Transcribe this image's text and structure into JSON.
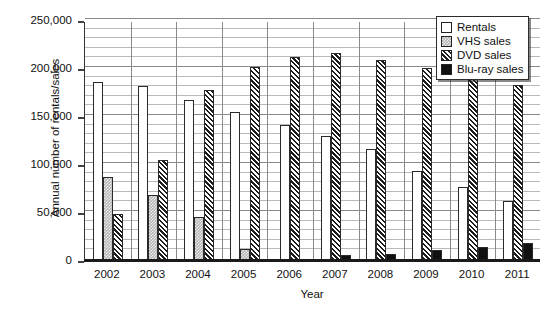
{
  "chart_data": {
    "type": "bar",
    "title": "",
    "xlabel": "Year",
    "ylabel": "Annual number of rentals/sales",
    "categories": [
      "2002",
      "2003",
      "2004",
      "2005",
      "2006",
      "2007",
      "2008",
      "2009",
      "2010",
      "2011"
    ],
    "ylim": [
      0,
      250000
    ],
    "ytick_labels": [
      "0",
      "50,000",
      "100,000",
      "150,000",
      "200,000",
      "250,000"
    ],
    "ytick_values": [
      0,
      50000,
      100000,
      150000,
      200000,
      250000
    ],
    "minor_gridline_step": 10000,
    "grid": true,
    "legend_position": "top-right",
    "series": [
      {
        "name": "Rentals",
        "pattern": "open-white",
        "color": "#ffffff",
        "values": [
          184000,
          180000,
          166000,
          153000,
          140000,
          128000,
          115000,
          92000,
          75000,
          60000
        ]
      },
      {
        "name": "VHS sales",
        "pattern": "light-stipple-gray",
        "color": "#b5b5b5",
        "values": [
          85000,
          67000,
          44000,
          10000,
          0,
          0,
          0,
          0,
          0,
          0
        ]
      },
      {
        "name": "DVD sales",
        "pattern": "diagonal-hatch",
        "color": "#1c1c1c",
        "values": [
          47000,
          103000,
          176000,
          200000,
          210000,
          215000,
          207000,
          199000,
          189000,
          181000
        ]
      },
      {
        "name": "Blu-ray sales",
        "pattern": "solid-black",
        "color": "#111111",
        "values": [
          0,
          0,
          0,
          0,
          0,
          4000,
          5000,
          9000,
          12000,
          17000
        ]
      }
    ]
  },
  "legend": {
    "items": [
      {
        "label": "Rentals"
      },
      {
        "label": "VHS sales"
      },
      {
        "label": "DVD sales"
      },
      {
        "label": "Blu-ray sales"
      }
    ]
  }
}
